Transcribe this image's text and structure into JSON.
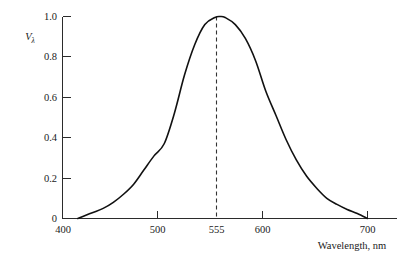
{
  "chart_data": {
    "type": "line",
    "title": "",
    "xlabel": "Wavelength, nm",
    "ylabel": "Vλ",
    "ylabel_base": "V",
    "ylabel_sub": "λ",
    "xlim": [
      400,
      715
    ],
    "ylim": [
      0,
      1.0
    ],
    "grid": false,
    "legend": "none",
    "x_ticks": [
      400,
      500,
      555,
      600,
      700
    ],
    "x_tick_labels": [
      "400",
      "500",
      "555",
      "600",
      "700"
    ],
    "y_ticks": [
      0,
      0.2,
      0.4,
      0.6,
      0.8,
      1.0
    ],
    "y_tick_labels": [
      "0",
      "0.2",
      "0.4",
      "0.6",
      "0.8",
      "1.0"
    ],
    "series": [
      {
        "name": "Photopic luminous efficiency",
        "x": [
          415,
          420,
          430,
          440,
          450,
          460,
          470,
          480,
          490,
          500,
          510,
          520,
          530,
          540,
          550,
          555,
          560,
          570,
          580,
          590,
          600,
          610,
          620,
          630,
          640,
          650,
          660,
          670,
          680,
          690,
          700
        ],
        "values": [
          0.0,
          0.01,
          0.03,
          0.05,
          0.08,
          0.12,
          0.17,
          0.24,
          0.31,
          0.37,
          0.52,
          0.71,
          0.86,
          0.96,
          0.995,
          1.0,
          0.995,
          0.96,
          0.89,
          0.78,
          0.63,
          0.51,
          0.39,
          0.29,
          0.21,
          0.15,
          0.1,
          0.07,
          0.045,
          0.025,
          0.0
        ]
      }
    ],
    "annotations": [
      {
        "name": "peak-marker",
        "kind": "dashed-vertical",
        "x": 555,
        "y_from": 0,
        "y_to": 1.0
      }
    ]
  }
}
